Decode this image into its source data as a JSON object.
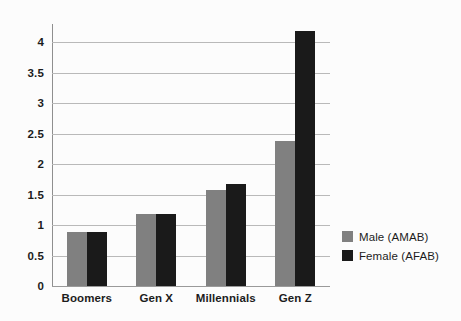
{
  "chart_data": {
    "type": "bar",
    "title": "",
    "xlabel": "",
    "ylabel": "",
    "categories": [
      "Boomers",
      "Gen X",
      "Millennials",
      "Gen Z"
    ],
    "series": [
      {
        "name": "Male (AMAB)",
        "color": "#808080",
        "values": [
          0.89,
          1.18,
          1.58,
          2.38
        ]
      },
      {
        "name": "Female (AFAB)",
        "color": "#1a1a1a",
        "values": [
          0.89,
          1.19,
          1.68,
          4.18
        ]
      }
    ],
    "ylim": [
      0,
      4.3
    ],
    "y_ticks": [
      0,
      0.5,
      1,
      1.5,
      2,
      2.5,
      3,
      3.5,
      4
    ],
    "y_tick_labels": [
      "0",
      "0.5",
      "1",
      "1.5",
      "2",
      "2.5",
      "3",
      "3.5",
      "4"
    ],
    "grid": true,
    "legend_position": "right"
  },
  "style": {
    "background": "#fcfcfc",
    "gridline_color": "#b9b9b9",
    "axis_color": "#8f8f8f",
    "text_color": "#1c1c1c"
  }
}
